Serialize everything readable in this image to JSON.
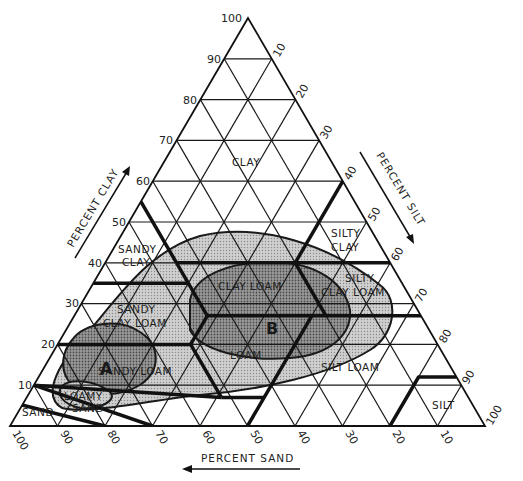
{
  "diagram": {
    "type": "soil-texture-triangle",
    "axes": {
      "clay": {
        "label": "PERCENT CLAY",
        "ticks": [
          "10",
          "20",
          "30",
          "40",
          "50",
          "60",
          "70",
          "80",
          "90",
          "100"
        ]
      },
      "silt": {
        "label": "PERCENT SILT",
        "ticks": [
          "10",
          "20",
          "30",
          "40",
          "50",
          "60",
          "70",
          "80",
          "90",
          "100"
        ]
      },
      "sand": {
        "label": "PERCENT SAND",
        "ticks": [
          "100",
          "90",
          "80",
          "70",
          "60",
          "50",
          "40",
          "30",
          "20",
          "10"
        ]
      }
    },
    "texture_classes": {
      "clay": "CLAY",
      "sandy_clay_1": "SANDY",
      "sandy_clay_2": "CLAY",
      "silty_clay_1": "SILTY",
      "silty_clay_2": "CLAY",
      "silty_clay_loam_1": "SILTY",
      "silty_clay_loam_2": "CLAY LOAM",
      "clay_loam": "CLAY LOAM",
      "sandy_clay_loam_1": "SANDY",
      "sandy_clay_loam_2": "CLAY LOAM",
      "loam": "LOAM",
      "sandy_loam": "SANDY LOAM",
      "silt_loam": "SILT LOAM",
      "silt": "SILT",
      "loamy_sand_1": "LOAMY",
      "loamy_sand_2": "SAND",
      "sand": "SAND"
    },
    "regions": {
      "a": {
        "label": "A"
      },
      "b": {
        "label": "B"
      }
    },
    "colors": {
      "line": "#1a1a1a",
      "outer_region": "#c4c4c4",
      "inner_region": "#8e8e8e",
      "background": "#ffffff"
    }
  }
}
